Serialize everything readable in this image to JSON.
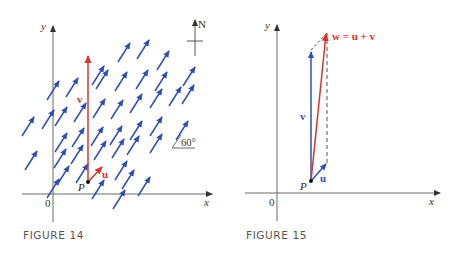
{
  "figure14": {
    "caption": "FIGURE 14",
    "y_label": "y",
    "x_label": "x",
    "origin_label": "0",
    "point_label": "P",
    "vector_v_label": "v",
    "vector_u_label": "u",
    "compass_label": "N",
    "angle_label": "60°",
    "field_angle_deg": 60,
    "colors": {
      "field_arrows": "#2f4fb8",
      "vectors": "#e0302a",
      "axes": "#6b6b6b"
    }
  },
  "figure15": {
    "caption": "FIGURE 15",
    "y_label": "y",
    "x_label": "x",
    "origin_label": "0",
    "point_label": "P",
    "vector_v_label": "v",
    "vector_u_label": "u",
    "sum_label": "w = u + v",
    "colors": {
      "u_v_vectors": "#2f4fb8",
      "w_vector": "#e0302a",
      "dashed": "#555555",
      "axes": "#6b6b6b"
    }
  }
}
